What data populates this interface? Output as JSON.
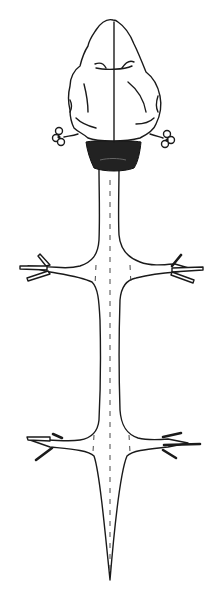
{
  "figure": {
    "parts": [
      {
        "name": "cerebral-hemispheres"
      },
      {
        "name": "optic-lobes-dark-region"
      },
      {
        "name": "spinal-cord"
      },
      {
        "name": "brachial-nerves-left"
      },
      {
        "name": "brachial-nerves-right"
      },
      {
        "name": "lumbar-nerves-left"
      },
      {
        "name": "lumbar-nerves-right"
      },
      {
        "name": "ear-structure-left"
      },
      {
        "name": "ear-structure-right"
      }
    ],
    "colors": {
      "ink": "#1a1a1a",
      "background": "#ffffff",
      "dark_region": "#222222"
    }
  }
}
